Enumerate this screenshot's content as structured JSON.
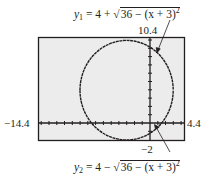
{
  "figure": {
    "equation_top": {
      "lhs": "y",
      "subscript": "1",
      "rhs_prefix": " = 4 + ",
      "radical": "√",
      "radicand": "36 − (x + 3)",
      "exponent": "2",
      "full_text": "y1 = 4 + √36 − (x + 3)²"
    },
    "equation_bottom": {
      "lhs": "y",
      "subscript": "2",
      "rhs_prefix": " = 4 − ",
      "radical": "√",
      "radicand": "36 − (x + 3)",
      "exponent": "2",
      "full_text": "y2 = 4 − √36 − (x + 3)²"
    },
    "window": {
      "xmin_label": "−14.4",
      "xmax_label": "4.4",
      "ymin_label": "−2",
      "ymax_label": "10.4",
      "xmin": -14.4,
      "xmax": 4.4,
      "ymin": -2,
      "ymax": 10.4
    },
    "circle": {
      "center_x": -3,
      "center_y": 4,
      "radius": 6
    },
    "colors": {
      "screen_bg": "#ececec",
      "ink": "#231f20",
      "page_bg": "#ffffff"
    }
  }
}
